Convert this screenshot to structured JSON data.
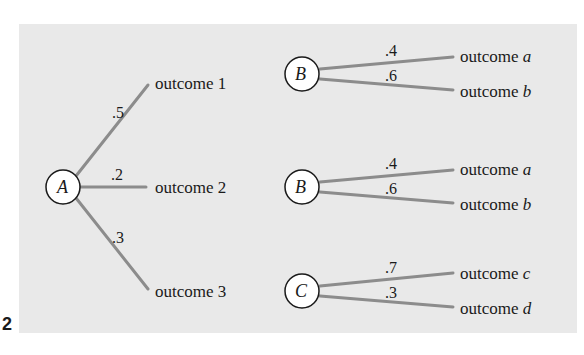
{
  "diagram": {
    "type": "probability-tree",
    "colors": {
      "panel_bg": "#e9e9e9",
      "edge": "#8c8c8c",
      "node_fill": "#ffffff",
      "text": "#1a1a1a"
    },
    "corner_label": "2",
    "root": {
      "letter": "A",
      "branches": [
        {
          "prob": ".5",
          "outcome": "outcome 1"
        },
        {
          "prob": ".2",
          "outcome": "outcome 2"
        },
        {
          "prob": ".3",
          "outcome": "outcome 3"
        }
      ]
    },
    "subtrees": [
      {
        "letter": "B",
        "branches": [
          {
            "prob": ".4",
            "outcome_word": "outcome",
            "outcome_var": "a"
          },
          {
            "prob": ".6",
            "outcome_word": "outcome",
            "outcome_var": "b"
          }
        ]
      },
      {
        "letter": "B",
        "branches": [
          {
            "prob": ".4",
            "outcome_word": "outcome",
            "outcome_var": "a"
          },
          {
            "prob": ".6",
            "outcome_word": "outcome",
            "outcome_var": "b"
          }
        ]
      },
      {
        "letter": "C",
        "branches": [
          {
            "prob": ".7",
            "outcome_word": "outcome",
            "outcome_var": "c"
          },
          {
            "prob": ".3",
            "outcome_word": "outcome",
            "outcome_var": "d"
          }
        ]
      }
    ]
  }
}
